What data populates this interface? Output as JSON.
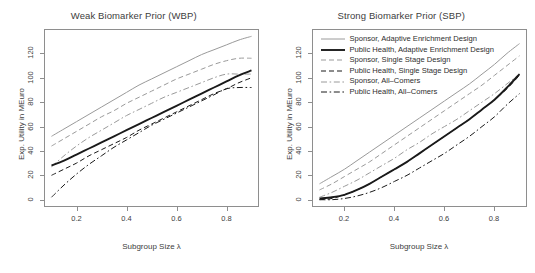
{
  "figure": {
    "axis_label_y": "Exp. Utility in MEuro",
    "axis_label_x": "Subgroup Size λ"
  },
  "legend": {
    "items": [
      {
        "label": "Sponsor, Adaptive Enrichment Design",
        "style": "solid-thin",
        "color": "#9a9a9a"
      },
      {
        "label": "Public Health, Adaptive Enrichment Design",
        "style": "solid-thick",
        "color": "#1a1a1a"
      },
      {
        "label": "Sponsor, Single Stage Design",
        "style": "dashed",
        "color": "#9a9a9a"
      },
      {
        "label": "Public Health, Single Stage Design",
        "style": "dashed",
        "color": "#1a1a1a"
      },
      {
        "label": "Sponsor, All–Comers",
        "style": "dashdot",
        "color": "#9a9a9a"
      },
      {
        "label": "Public Health, All–Comers",
        "style": "dashdot",
        "color": "#1a1a1a"
      }
    ]
  },
  "chart_data": [
    {
      "type": "line",
      "panel": "left",
      "title": "Weak Biomarker Prior (WBP)",
      "xlabel": "Subgroup Size λ",
      "ylabel": "Exp. Utility in MEuro",
      "xlim": [
        0.07,
        0.93
      ],
      "ylim": [
        -6,
        140
      ],
      "xticks": [
        0.2,
        0.4,
        0.6,
        0.8
      ],
      "yticks": [
        0,
        20,
        40,
        60,
        80,
        100,
        120
      ],
      "grid": false,
      "legend_position": "none",
      "x": [
        0.1,
        0.15,
        0.2,
        0.25,
        0.3,
        0.35,
        0.4,
        0.45,
        0.5,
        0.55,
        0.6,
        0.65,
        0.7,
        0.75,
        0.8,
        0.85,
        0.9
      ],
      "series": [
        {
          "name": "Sponsor, Adaptive Enrichment Design",
          "style": "solid-thin",
          "color": "#9a9a9a",
          "values": [
            52,
            58,
            64,
            70,
            76,
            82,
            88,
            94,
            99,
            104,
            109,
            114,
            119,
            123,
            127,
            131,
            134
          ]
        },
        {
          "name": "Sponsor, Single Stage Design",
          "style": "dashed",
          "color": "#9a9a9a",
          "values": [
            44,
            50,
            56,
            62,
            68,
            73,
            79,
            84,
            89,
            94,
            99,
            103,
            107,
            111,
            114,
            116,
            116
          ]
        },
        {
          "name": "Sponsor, All–Comers",
          "style": "dashdot",
          "color": "#9a9a9a",
          "values": [
            27,
            36,
            44,
            51,
            57,
            63,
            69,
            74,
            79,
            84,
            88,
            92,
            96,
            100,
            103,
            103,
            103
          ]
        },
        {
          "name": "Public Health, Adaptive Enrichment Design",
          "style": "solid-thick",
          "color": "#1a1a1a",
          "values": [
            28,
            32,
            37,
            42,
            47,
            52,
            57,
            62,
            67,
            72,
            77,
            82,
            87,
            92,
            97,
            102,
            106
          ]
        },
        {
          "name": "Public Health, Single Stage Design",
          "style": "dashed",
          "color": "#1a1a1a",
          "values": [
            20,
            25,
            30,
            36,
            41,
            46,
            51,
            57,
            62,
            67,
            72,
            77,
            82,
            87,
            91,
            96,
            100
          ]
        },
        {
          "name": "Public Health, All–Comers",
          "style": "dashdot",
          "color": "#1a1a1a",
          "values": [
            2,
            12,
            21,
            29,
            36,
            43,
            49,
            55,
            61,
            66,
            71,
            76,
            81,
            86,
            91,
            92,
            92
          ]
        }
      ]
    },
    {
      "type": "line",
      "panel": "right",
      "title": "Strong Biomarker Prior (SBP)",
      "xlabel": "Subgroup Size λ",
      "ylabel": "Exp. Utility in MEuro",
      "xlim": [
        0.07,
        0.93
      ],
      "ylim": [
        -6,
        140
      ],
      "xticks": [
        0.2,
        0.4,
        0.6,
        0.8
      ],
      "yticks": [
        0,
        20,
        40,
        60,
        80,
        100,
        120
      ],
      "grid": false,
      "legend_position": "top-left",
      "x": [
        0.1,
        0.15,
        0.2,
        0.25,
        0.3,
        0.35,
        0.4,
        0.45,
        0.5,
        0.55,
        0.6,
        0.65,
        0.7,
        0.75,
        0.8,
        0.85,
        0.9
      ],
      "series": [
        {
          "name": "Sponsor, Adaptive Enrichment Design",
          "style": "solid-thin",
          "color": "#9a9a9a",
          "values": [
            13,
            19,
            25,
            32,
            39,
            46,
            53,
            60,
            67,
            74,
            81,
            88,
            95,
            103,
            111,
            120,
            128
          ]
        },
        {
          "name": "Sponsor, Single Stage Design",
          "style": "dashed",
          "color": "#9a9a9a",
          "values": [
            8,
            13,
            19,
            25,
            31,
            38,
            45,
            52,
            59,
            66,
            73,
            80,
            87,
            94,
            102,
            110,
            118
          ]
        },
        {
          "name": "Sponsor, All–Comers",
          "style": "dashdot",
          "color": "#9a9a9a",
          "values": [
            2,
            6,
            11,
            16,
            22,
            28,
            34,
            41,
            47,
            54,
            60,
            66,
            73,
            80,
            87,
            95,
            103
          ]
        },
        {
          "name": "Public Health, Adaptive Enrichment Design",
          "style": "solid-thick",
          "color": "#1a1a1a",
          "values": [
            1,
            2,
            4,
            8,
            13,
            19,
            25,
            31,
            38,
            45,
            52,
            59,
            66,
            74,
            82,
            92,
            103
          ]
        },
        {
          "name": "Public Health, Single Stage Design",
          "style": "dashed",
          "color": "#1a1a1a",
          "values": [
            0,
            1,
            4,
            8,
            13,
            19,
            25,
            31,
            38,
            45,
            52,
            59,
            66,
            74,
            82,
            91,
            102
          ]
        },
        {
          "name": "Public Health, All–Comers",
          "style": "dashdot",
          "color": "#1a1a1a",
          "values": [
            0,
            0,
            1,
            3,
            6,
            10,
            15,
            20,
            26,
            32,
            38,
            45,
            52,
            60,
            68,
            78,
            87
          ]
        }
      ]
    }
  ]
}
